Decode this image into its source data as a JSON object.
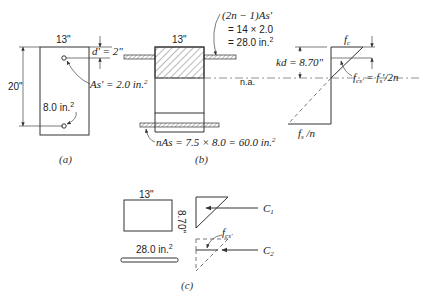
{
  "figure": {
    "panel_a": {
      "caption": "(a)",
      "width_label": "13\"",
      "height_label": "20\"",
      "dprime_label": "d' = 2\"",
      "as_prime_label": "As' = 2.0 in.",
      "as_prime_sup": "2",
      "as_label": "8.0 in.",
      "as_sup": "2"
    },
    "panel_b": {
      "caption": "(b)",
      "width_label": "13\"",
      "transformed_comp_line1": "(2n − 1)As'",
      "transformed_comp_line2": "= 14 × 2.0",
      "transformed_comp_line3": "= 28.0 in.",
      "transformed_comp_sup": "2",
      "neutral_axis_label": "n.a.",
      "transformed_tension": "nAs = 7.5 × 8.0 = 60.0 in.",
      "transformed_tension_sup": "2"
    },
    "stress_diagram": {
      "fc_label": "fc",
      "two_inch_label": "2\"",
      "kd_label": "kd = 8.70\"",
      "fcs_label": "fcs' = fs'/2n",
      "fs_n_label": "fs /n"
    },
    "panel_c": {
      "caption": "(c)",
      "width_label": "13\"",
      "depth_label": "8.70\"",
      "area_label": "28.0 in.",
      "area_sup": "2",
      "fcs_label": "fcs'",
      "c1_label": "C1",
      "c2_label": "C2"
    }
  },
  "colors": {
    "ink": "#333333",
    "hatch": "#555555",
    "background": "#ffffff"
  }
}
